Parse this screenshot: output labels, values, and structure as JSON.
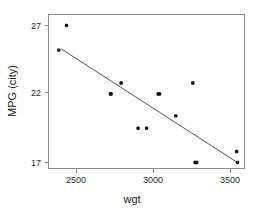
{
  "chart_data": {
    "type": "scatter",
    "title": "",
    "xlabel": "wgt",
    "ylabel": "MPG (city)",
    "xlim": [
      2330,
      3600
    ],
    "ylim": [
      16.3,
      27.6
    ],
    "xticks": [
      2500,
      3000,
      3500
    ],
    "xtick_labels": [
      "2500",
      "3000",
      "3500"
    ],
    "yticks": [
      17,
      22,
      27
    ],
    "ytick_labels": [
      "17",
      "22",
      "27"
    ],
    "grid": false,
    "legend": null,
    "point_color": "#121212",
    "line_color": "#555555",
    "frame_color": "#8c8c8c",
    "x": [
      2435,
      2385,
      2720,
      2725,
      2790,
      2900,
      2955,
      3030,
      3040,
      3145,
      3255,
      3270,
      3280,
      3540,
      3545
    ],
    "y": [
      27.0,
      25.2,
      22.0,
      22.0,
      22.8,
      19.5,
      19.5,
      22.0,
      22.0,
      20.4,
      22.8,
      17.0,
      17.0,
      17.8,
      17.0
    ],
    "points": [
      {
        "x": 2435,
        "y": 27.0
      },
      {
        "x": 2385,
        "y": 25.2
      },
      {
        "x": 2720,
        "y": 22.0
      },
      {
        "x": 2725,
        "y": 22.0
      },
      {
        "x": 2790,
        "y": 22.8
      },
      {
        "x": 2900,
        "y": 19.5
      },
      {
        "x": 2955,
        "y": 19.5
      },
      {
        "x": 3030,
        "y": 22.0
      },
      {
        "x": 3040,
        "y": 22.0
      },
      {
        "x": 3145,
        "y": 20.4
      },
      {
        "x": 3255,
        "y": 22.8
      },
      {
        "x": 3270,
        "y": 17.0
      },
      {
        "x": 3280,
        "y": 17.0
      },
      {
        "x": 3540,
        "y": 17.8
      },
      {
        "x": 3545,
        "y": 17.0
      }
    ],
    "fit_line": {
      "name": "least-squares fit",
      "x_start": 2400,
      "y_start": 25.3,
      "x_end": 3545,
      "y_end": 17.0
    }
  }
}
